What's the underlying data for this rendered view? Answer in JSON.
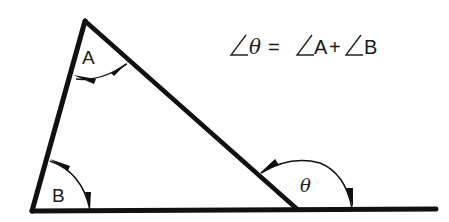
{
  "diagram": {
    "formula": {
      "lhs_angle": "θ",
      "equals": "=",
      "term1": "A",
      "plus": "+",
      "term2": "B",
      "angle_symbol": "∠"
    },
    "labels": {
      "angle_a": "A",
      "angle_b": "B",
      "angle_theta": "θ"
    },
    "colors": {
      "stroke": "#111111",
      "background": "#ffffff"
    }
  }
}
